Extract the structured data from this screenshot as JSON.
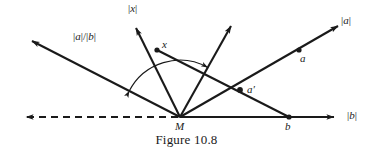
{
  "figure": {
    "caption": "Figure 10.8",
    "stroke_color": "#1a1a1a",
    "background_color": "#ffffff",
    "vertex_label": "M",
    "labels": {
      "ray_x_magnitude": "|x|",
      "ray_a_magnitude": "|a|",
      "ray_b_magnitude": "|b|",
      "ray_ratio": "|a|/|b|",
      "point_x": "x",
      "point_a": "a",
      "point_a_prime": "a′",
      "point_b": "b",
      "point_m": "M"
    },
    "points": [
      {
        "name": "M",
        "label": "M",
        "x": 180,
        "y": 117
      },
      {
        "name": "x",
        "label": "x",
        "x": 157,
        "y": 50
      },
      {
        "name": "a",
        "label": "a",
        "x": 299,
        "y": 50
      },
      {
        "name": "a-prime",
        "label": "a′",
        "x": 240,
        "y": 90
      },
      {
        "name": "b",
        "label": "b",
        "x": 289,
        "y": 117
      }
    ],
    "rays": [
      {
        "name": "ray-x",
        "label": "|x|",
        "from": [
          180,
          117
        ],
        "to": [
          133,
          22
        ],
        "dashed": false,
        "arrow": true
      },
      {
        "name": "ray-unlabeled",
        "label": "",
        "from": [
          180,
          117
        ],
        "to": [
          233,
          21
        ],
        "dashed": false,
        "arrow": true
      },
      {
        "name": "ray-a",
        "label": "|a|",
        "from": [
          180,
          117
        ],
        "to": [
          345,
          22
        ],
        "dashed": false,
        "arrow": true
      },
      {
        "name": "ray-b",
        "label": "|b|",
        "from": [
          180,
          117
        ],
        "to": [
          341,
          117
        ],
        "dashed": false,
        "arrow": true
      },
      {
        "name": "ray-ratio",
        "label": "|a|/|b|",
        "from": [
          180,
          117
        ],
        "to": [
          25,
          37
        ],
        "dashed": false,
        "arrow": true
      },
      {
        "name": "ray-dashed-left",
        "label": "",
        "from": [
          178,
          117
        ],
        "to": [
          19,
          117
        ],
        "dashed": true,
        "arrow": true
      }
    ],
    "segments": [
      {
        "name": "segment-x-b",
        "from": [
          157,
          50
        ],
        "to": [
          289,
          117
        ]
      }
    ],
    "arc": {
      "name": "angle-arc",
      "center": [
        180,
        117
      ],
      "radius": 57,
      "start_angle_deg": 207,
      "end_angle_deg": 299,
      "arrow_start": true,
      "arrow_end": true
    },
    "label_positions": {
      "ray_x_magnitude": {
        "x": 128,
        "y": 4
      },
      "ray_a_magnitude": {
        "x": 340,
        "y": 16
      },
      "ray_b_magnitude": {
        "x": 347,
        "y": 110
      },
      "ray_ratio": {
        "x": 74,
        "y": 32
      },
      "point_x": {
        "x": 161,
        "y": 40
      },
      "point_a": {
        "x": 300,
        "y": 54
      },
      "point_a_prime": {
        "x": 246,
        "y": 85
      },
      "point_b": {
        "x": 285,
        "y": 121
      },
      "point_m": {
        "x": 175,
        "y": 121
      }
    }
  }
}
